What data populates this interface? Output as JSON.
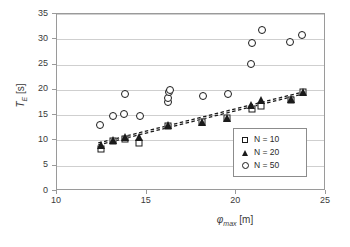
{
  "chart_data": {
    "type": "scatter",
    "title": "",
    "xlabel": "φmax [m]",
    "xlabel_symbol": "φ",
    "xlabel_sub": "max",
    "xlabel_unit": "[m]",
    "ylabel": "TE [s]",
    "ylabel_symbol": "T",
    "ylabel_sub": "E",
    "ylabel_unit": "[s]",
    "xlim": [
      10,
      25
    ],
    "ylim": [
      0,
      35
    ],
    "xticks": [
      10,
      15,
      20,
      25
    ],
    "yticks": [
      0,
      5,
      10,
      15,
      20,
      25,
      30,
      35
    ],
    "grid": "horizontal",
    "legend_position": "inside-right-lower",
    "series": [
      {
        "name": "N = 10",
        "marker": "open-square",
        "color": "#1a1a1a",
        "points": [
          [
            12.45,
            8.3
          ],
          [
            13.15,
            9.9
          ],
          [
            13.8,
            10.3
          ],
          [
            14.6,
            9.4
          ],
          [
            16.2,
            12.8
          ],
          [
            18.1,
            13.6
          ],
          [
            19.5,
            14.4
          ],
          [
            20.85,
            16.3
          ],
          [
            21.35,
            16.9
          ],
          [
            23.05,
            17.9
          ],
          [
            23.7,
            19.5
          ]
        ]
      },
      {
        "name": "N = 20",
        "marker": "filled-triangle",
        "color": "#1a1a1a",
        "points": [
          [
            12.45,
            9.1
          ],
          [
            13.15,
            10.0
          ],
          [
            13.8,
            10.6
          ],
          [
            14.55,
            10.6
          ],
          [
            16.2,
            13.1
          ],
          [
            18.1,
            13.7
          ],
          [
            19.5,
            14.5
          ],
          [
            20.8,
            17.0
          ],
          [
            21.4,
            18.0
          ],
          [
            23.05,
            18.2
          ],
          [
            23.7,
            19.6
          ]
        ]
      },
      {
        "name": "N = 50",
        "marker": "open-circle",
        "color": "#1a1a1a",
        "points": [
          [
            12.4,
            13.0
          ],
          [
            13.1,
            14.8
          ],
          [
            13.75,
            15.2
          ],
          [
            13.8,
            19.2
          ],
          [
            14.65,
            14.9
          ],
          [
            16.2,
            17.6
          ],
          [
            16.2,
            18.3
          ],
          [
            16.25,
            19.5
          ],
          [
            16.3,
            20.0
          ],
          [
            18.15,
            18.7
          ],
          [
            19.55,
            19.1
          ],
          [
            20.8,
            25.1
          ],
          [
            20.85,
            29.2
          ],
          [
            21.45,
            31.8
          ],
          [
            23.0,
            29.4
          ],
          [
            23.65,
            30.8
          ]
        ]
      }
    ],
    "trendlines": [
      {
        "name": "trend-N10",
        "style": "dashed",
        "x0": 12.3,
        "y0": 9.1,
        "x1": 23.85,
        "y1": 19.3
      },
      {
        "name": "trend-N20",
        "style": "dashed",
        "x0": 12.3,
        "y0": 9.5,
        "x1": 23.85,
        "y1": 19.7
      }
    ],
    "legend": [
      {
        "label": "N = 10",
        "marker": "open-square"
      },
      {
        "label": "N = 20",
        "marker": "filled-triangle"
      },
      {
        "label": "N = 50",
        "marker": "open-circle"
      }
    ]
  }
}
